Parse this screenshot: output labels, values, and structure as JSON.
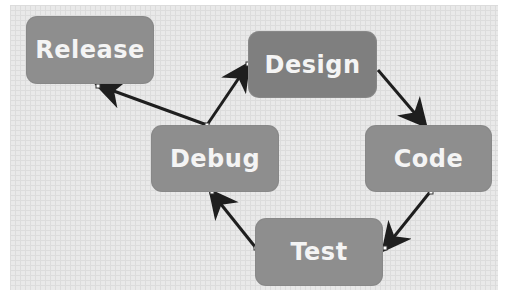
{
  "diagram": {
    "type": "cycle-flowchart",
    "nodes": [
      {
        "id": "release",
        "label": "Release"
      },
      {
        "id": "design",
        "label": "Design"
      },
      {
        "id": "code",
        "label": "Code"
      },
      {
        "id": "test",
        "label": "Test"
      },
      {
        "id": "debug",
        "label": "Debug"
      }
    ],
    "edges": [
      {
        "from": "design",
        "to": "code"
      },
      {
        "from": "code",
        "to": "test"
      },
      {
        "from": "test",
        "to": "debug"
      },
      {
        "from": "debug",
        "to": "design"
      },
      {
        "from": "debug",
        "to": "release"
      }
    ],
    "colors": {
      "node_fill": "#8e8e8e",
      "node_text": "#f4f4f4",
      "arrow": "#1e1e1e",
      "canvas": "#e9e9e9"
    }
  }
}
